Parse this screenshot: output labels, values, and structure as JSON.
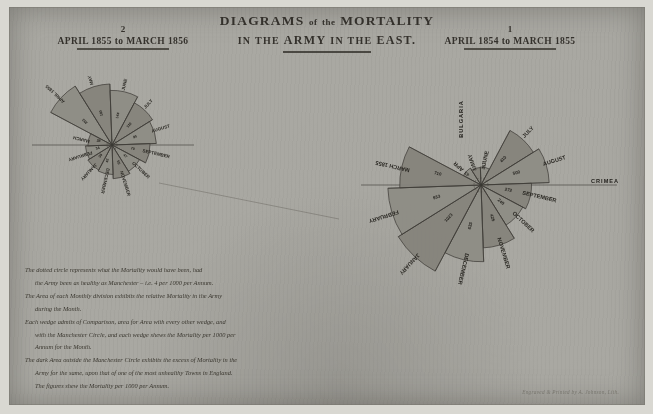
{
  "title": {
    "line1_main": "DIAGRAMS",
    "line1_of": "of",
    "line1_the": "the",
    "line1_tail": "MORTALITY",
    "line2_in": "IN",
    "line2_the": "THE",
    "line2_army": "ARMY",
    "line2_in2": "IN",
    "line2_the2": "THE",
    "line2_east": "EAST."
  },
  "panels": {
    "left": {
      "number": "2",
      "period": "APRIL 1855 to MARCH 1856"
    },
    "right": {
      "number": "1",
      "period": "APRIL 1854 to MARCH 1855"
    }
  },
  "caption": {
    "lines": [
      "The dotted circle represents what the Mortality would have been, had",
      "the Army been as healthy as Manchester – i.e. 4 per 1000 per Annum.",
      "The Area of each Monthly division exhibits the relative Mortality in the Army",
      "during the Month.",
      "Each wedge admits of Comparison, area for Area with every other wedge, and",
      "with the Manchester Circle, and each wedge shews the Mortality per 1000 per",
      "Annum for the Month.",
      "The dark Area outside the Manchester Circle exhibits the excess of Mortality in the",
      "Army for the same, upon that of one of the most unhealthy Towns in England.",
      "The figures shew the Mortality per 1000 per Annum."
    ]
  },
  "signature": "Engraved & Printed by A. Johnson, Lith.",
  "chart_data": [
    {
      "type": "pie",
      "title": "APRIL 1854 to MARCH 1855",
      "subtitle": "Diagram 1",
      "units": "deaths per 1000 per annum",
      "reference_circle": 4,
      "region_labels": [
        "BULGARIA",
        "CRIMEA"
      ],
      "categories": [
        "APRIL 1854",
        "MAY",
        "JUNE",
        "JULY",
        "AUGUST",
        "SEPTEMBER",
        "OCTOBER",
        "NOVEMBER",
        "DECEMBER",
        "JANUARY 1855",
        "FEBRUARY",
        "MARCH 1855"
      ],
      "values": [
        43,
        33,
        35,
        410,
        500,
        275,
        240,
        425,
        633,
        1023,
        933,
        710
      ],
      "value_labels": [
        "43",
        "33",
        "35",
        "410",
        "500",
        "272",
        "240",
        "425",
        "633",
        "1023",
        "933",
        "710"
      ]
    },
    {
      "type": "pie",
      "title": "APRIL 1855 to MARCH 1856",
      "subtitle": "Diagram 2",
      "units": "deaths per 1000 per annum",
      "reference_circle": 4,
      "region_labels": [
        "BULGARIA",
        "CRIMEA"
      ],
      "categories": [
        "APRIL 1855",
        "MAY",
        "JUNE",
        "JULY",
        "AUGUST",
        "SEPTEMBER",
        "OCTOBER",
        "NOVEMBER",
        "DECEMBER",
        "JANUARY 1856",
        "FEBRUARY",
        "MARCH 1856"
      ],
      "values": [
        233,
        180,
        144,
        110,
        95,
        70,
        47,
        55,
        42,
        39,
        34,
        28
      ],
      "value_labels": [
        "233",
        "180",
        "144",
        "110",
        "95",
        "70",
        "47",
        "55",
        "42",
        "39",
        "34",
        "28"
      ]
    }
  ],
  "month_labels": {
    "right": [
      "APR",
      "MAY",
      "JUNE",
      "JULY",
      "AUGUST",
      "SEPTEMBER",
      "OCTOBER",
      "NOVEMBER",
      "DECEMBER",
      "JANUARY",
      "FEBRUARY",
      "MARCH 1855"
    ],
    "left": [
      "APRIL 1855",
      "MAY",
      "JUNE",
      "JULY",
      "AUGUST",
      "SEPTEMBER",
      "OCTOBER",
      "NOVEMBER",
      "DECEMBER",
      "JANUARY",
      "FEBRUARY",
      "MARCH"
    ]
  },
  "colors": {
    "paper": "#a9a8a2",
    "ink": "#2c2a26",
    "wedge": "#8e8c85",
    "margin": "#d9d8d2"
  }
}
